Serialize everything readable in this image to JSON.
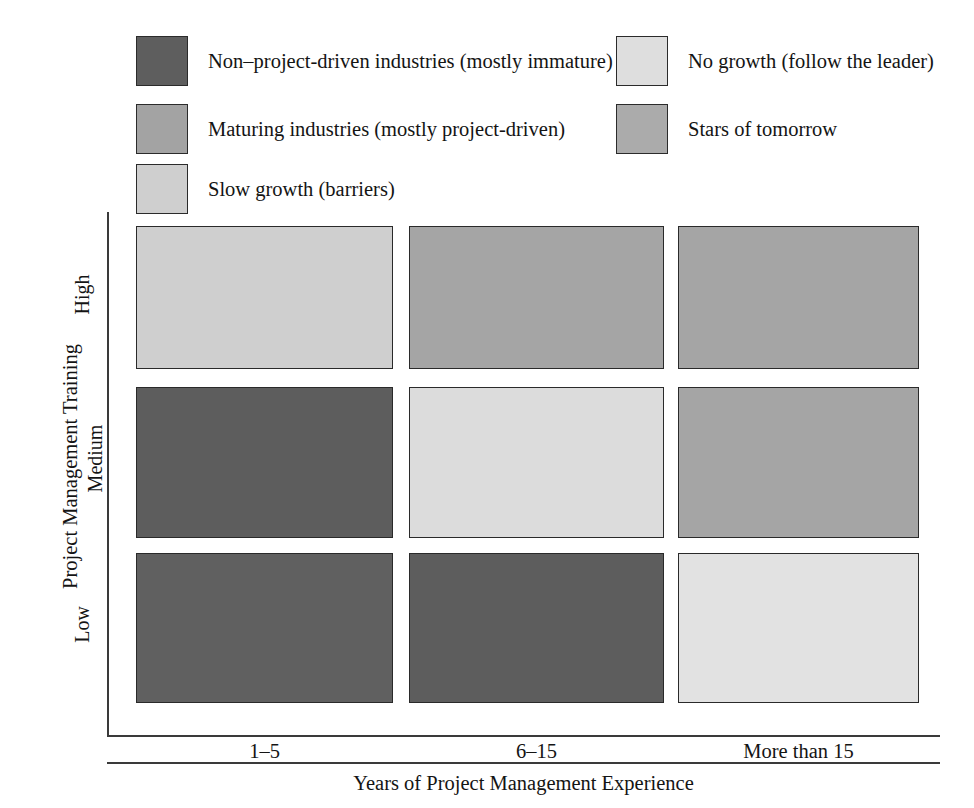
{
  "chart_data": {
    "type": "heatmap",
    "title": "",
    "xlabel": "Years of Project Management Experience",
    "ylabel": "Project Management Training",
    "x_categories": [
      "1–5",
      "6–15",
      "More than 15"
    ],
    "y_categories": [
      "High",
      "Medium",
      "Low"
    ],
    "grid": false,
    "legend_position": "top",
    "categories_legend": [
      {
        "key": "non_project_driven",
        "label": "Non–project-driven industries (mostly immature)",
        "color": "#5e5e5e"
      },
      {
        "key": "maturing",
        "label": "Maturing industries (mostly project-driven)",
        "color": "#a3a3a3"
      },
      {
        "key": "slow_growth",
        "label": "Slow growth (barriers)",
        "color": "#cfcfcf"
      },
      {
        "key": "no_growth",
        "label": "No growth (follow the leader)",
        "color": "#dedede"
      },
      {
        "key": "stars",
        "label": "Stars of tomorrow",
        "color": "#ababab"
      }
    ],
    "cells": [
      {
        "row": "High",
        "col": "1–5",
        "category": "slow_growth",
        "color": "#cfcfcf"
      },
      {
        "row": "High",
        "col": "6–15",
        "category": "stars",
        "color": "#a5a5a5"
      },
      {
        "row": "High",
        "col": "More than 15",
        "category": "stars",
        "color": "#a5a5a5"
      },
      {
        "row": "Medium",
        "col": "1–5",
        "category": "non_project_driven",
        "color": "#5d5d5d"
      },
      {
        "row": "Medium",
        "col": "6–15",
        "category": "no_growth",
        "color": "#dcdcdc"
      },
      {
        "row": "Medium",
        "col": "More than 15",
        "category": "stars",
        "color": "#a5a5a5"
      },
      {
        "row": "Low",
        "col": "1–5",
        "category": "non_project_driven",
        "color": "#606060"
      },
      {
        "row": "Low",
        "col": "6–15",
        "category": "non_project_driven",
        "color": "#5d5d5d"
      },
      {
        "row": "Low",
        "col": "More than 15",
        "category": "no_growth",
        "color": "#e2e2e2"
      }
    ]
  },
  "legend": {
    "items": [
      {
        "label": "Non–project-driven industries (mostly immature)",
        "color": "#5e5e5e"
      },
      {
        "label": "Maturing industries (mostly project-driven)",
        "color": "#a3a3a3"
      },
      {
        "label": "Slow growth (barriers)",
        "color": "#cfcfcf"
      },
      {
        "label": "No growth (follow the leader)",
        "color": "#dedede"
      },
      {
        "label": "Stars of tomorrow",
        "color": "#ababab"
      }
    ]
  },
  "axes": {
    "y_title": "Project Management Training",
    "y_ticks": [
      "High",
      "Medium",
      "Low"
    ],
    "x_title": "Years of Project Management Experience",
    "x_ticks": [
      "1–5",
      "6–15",
      "More than 15"
    ]
  }
}
